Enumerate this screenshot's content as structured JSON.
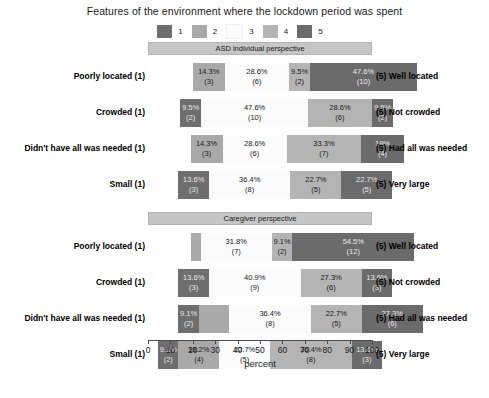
{
  "chart_data": {
    "type": "bar",
    "subtype": "diverging-stacked-likert",
    "title": "Features of the environment where the lockdown period was spent",
    "xlabel": "percent",
    "ylabel": "",
    "xlim": [
      0,
      100
    ],
    "xticks": [
      0,
      10,
      20,
      30,
      40,
      50,
      60,
      70,
      80,
      90,
      100
    ],
    "grid": false,
    "legend_position": "top",
    "legend": [
      {
        "label": "1",
        "color": "#6e6e6e"
      },
      {
        "label": "2",
        "color": "#a9a9a9"
      },
      {
        "label": "3",
        "color": "#fbfbfb"
      },
      {
        "label": "4",
        "color": "#b4b4b4"
      },
      {
        "label": "5",
        "color": "#6b6b6b"
      }
    ],
    "panels": [
      {
        "name": "ASD individual perspective",
        "rows": [
          {
            "left_label": "Poorly located (1)",
            "right_label": "(5) Well located",
            "start_percent": 20.0,
            "segments": [
              {
                "category": "1",
                "percent": 0,
                "count": 0,
                "pct_text": "",
                "count_text": "",
                "show_label": false
              },
              {
                "category": "2",
                "percent": 14.3,
                "count": 3,
                "pct_text": "14.3%",
                "count_text": "(3)",
                "show_label": true
              },
              {
                "category": "3",
                "percent": 28.6,
                "count": 6,
                "pct_text": "28.6%",
                "count_text": "(6)",
                "show_label": true
              },
              {
                "category": "4",
                "percent": 9.5,
                "count": 2,
                "pct_text": "9.5%",
                "count_text": "(2)",
                "show_label": true
              },
              {
                "category": "5",
                "percent": 47.6,
                "count": 10,
                "pct_text": "47.6%",
                "count_text": "(10)",
                "show_label": true
              }
            ]
          },
          {
            "left_label": "Crowded (1)",
            "right_label": "(5) Not crowded",
            "start_percent": 14.3,
            "segments": [
              {
                "category": "1",
                "percent": 9.5,
                "count": 2,
                "pct_text": "9.5%",
                "count_text": "(2)",
                "show_label": true
              },
              {
                "category": "2",
                "percent": 0,
                "count": 0,
                "pct_text": "",
                "count_text": "",
                "show_label": false
              },
              {
                "category": "3",
                "percent": 47.6,
                "count": 10,
                "pct_text": "47.6%",
                "count_text": "(10)",
                "show_label": true
              },
              {
                "category": "4",
                "percent": 28.6,
                "count": 6,
                "pct_text": "28.6%",
                "count_text": "(6)",
                "show_label": true
              },
              {
                "category": "5",
                "percent": 9.5,
                "count": 2,
                "pct_text": "9.5%",
                "count_text": "(2)",
                "show_label": true
              }
            ]
          },
          {
            "left_label": "Didn't have all was needed (1)",
            "right_label": "(5) Had all was needed",
            "start_percent": 19.0,
            "segments": [
              {
                "category": "1",
                "percent": 0,
                "count": 0,
                "pct_text": "",
                "count_text": "",
                "show_label": false
              },
              {
                "category": "2",
                "percent": 14.3,
                "count": 3,
                "pct_text": "14.3%",
                "count_text": "(3)",
                "show_label": true
              },
              {
                "category": "3",
                "percent": 28.6,
                "count": 6,
                "pct_text": "28.6%",
                "count_text": "(6)",
                "show_label": true
              },
              {
                "category": "4",
                "percent": 33.3,
                "count": 7,
                "pct_text": "33.3%",
                "count_text": "(7)",
                "show_label": true
              },
              {
                "category": "5",
                "percent": 19.0,
                "count": 4,
                "pct_text": "19%",
                "count_text": "(4)",
                "show_label": true
              }
            ]
          },
          {
            "left_label": "Small (1)",
            "right_label": "(5) Very large",
            "start_percent": 13.6,
            "segments": [
              {
                "category": "1",
                "percent": 13.6,
                "count": 3,
                "pct_text": "13.6%",
                "count_text": "(3)",
                "show_label": true
              },
              {
                "category": "2",
                "percent": 0,
                "count": 0,
                "pct_text": "",
                "count_text": "",
                "show_label": false
              },
              {
                "category": "3",
                "percent": 36.4,
                "count": 8,
                "pct_text": "36.4%",
                "count_text": "(8)",
                "show_label": true
              },
              {
                "category": "4",
                "percent": 22.7,
                "count": 5,
                "pct_text": "22.7%",
                "count_text": "(5)",
                "show_label": true
              },
              {
                "category": "5",
                "percent": 22.7,
                "count": 5,
                "pct_text": "22.7%",
                "count_text": "(5)",
                "show_label": true
              }
            ]
          }
        ]
      },
      {
        "name": "Caregiver perspective",
        "rows": [
          {
            "left_label": "Poorly located (1)",
            "right_label": "(5) Well located",
            "start_percent": 19.0,
            "segments": [
              {
                "category": "1",
                "percent": 0,
                "count": 0,
                "pct_text": "",
                "count_text": "",
                "show_label": false
              },
              {
                "category": "2",
                "percent": 4.5,
                "count": 1,
                "pct_text": "",
                "count_text": "",
                "show_label": false
              },
              {
                "category": "3",
                "percent": 31.8,
                "count": 7,
                "pct_text": "31.8%",
                "count_text": "(7)",
                "show_label": true
              },
              {
                "category": "4",
                "percent": 9.1,
                "count": 2,
                "pct_text": "9.1%",
                "count_text": "(2)",
                "show_label": true
              },
              {
                "category": "5",
                "percent": 54.5,
                "count": 12,
                "pct_text": "54.5%",
                "count_text": "(12)",
                "show_label": true
              }
            ]
          },
          {
            "left_label": "Crowded (1)",
            "right_label": "(5) Not crowded",
            "start_percent": 13.6,
            "segments": [
              {
                "category": "1",
                "percent": 13.6,
                "count": 3,
                "pct_text": "13.6%",
                "count_text": "(3)",
                "show_label": true
              },
              {
                "category": "2",
                "percent": 0,
                "count": 0,
                "pct_text": "",
                "count_text": "",
                "show_label": false
              },
              {
                "category": "3",
                "percent": 40.9,
                "count": 9,
                "pct_text": "40.9%",
                "count_text": "(9)",
                "show_label": true
              },
              {
                "category": "4",
                "percent": 27.3,
                "count": 6,
                "pct_text": "27.3%",
                "count_text": "(6)",
                "show_label": true
              },
              {
                "category": "5",
                "percent": 13.6,
                "count": 3,
                "pct_text": "13.6%",
                "count_text": "(3)",
                "show_label": true
              }
            ]
          },
          {
            "left_label": "Didn't have all was needed (1)",
            "right_label": "(5) Had all was needed",
            "start_percent": 13.6,
            "segments": [
              {
                "category": "1",
                "percent": 9.1,
                "count": 2,
                "pct_text": "9.1%",
                "count_text": "(2)",
                "show_label": true
              },
              {
                "category": "2",
                "percent": 13.6,
                "count": 3,
                "pct_text": "",
                "count_text": "",
                "show_label": false
              },
              {
                "category": "3",
                "percent": 36.4,
                "count": 8,
                "pct_text": "36.4%",
                "count_text": "(8)",
                "show_label": true
              },
              {
                "category": "4",
                "percent": 22.7,
                "count": 5,
                "pct_text": "22.7%",
                "count_text": "(5)",
                "show_label": true
              },
              {
                "category": "5",
                "percent": 27.3,
                "count": 6,
                "pct_text": "27.3%",
                "count_text": "(6)",
                "show_label": true
              }
            ]
          },
          {
            "left_label": "Small (1)",
            "right_label": "(5) Very large",
            "start_percent": 4.5,
            "segments": [
              {
                "category": "1",
                "percent": 9.1,
                "count": 2,
                "pct_text": "9.1%",
                "count_text": "(2)",
                "show_label": true
              },
              {
                "category": "2",
                "percent": 18.2,
                "count": 4,
                "pct_text": "18.2%",
                "count_text": "(4)",
                "show_label": true
              },
              {
                "category": "3",
                "percent": 22.7,
                "count": 5,
                "pct_text": "22.7%",
                "count_text": "(5)",
                "show_label": true
              },
              {
                "category": "4",
                "percent": 36.4,
                "count": 8,
                "pct_text": "36.4%",
                "count_text": "(8)",
                "show_label": true
              },
              {
                "category": "5",
                "percent": 13.6,
                "count": 3,
                "pct_text": "13.6%",
                "count_text": "(3)",
                "show_label": true
              }
            ]
          }
        ]
      }
    ]
  }
}
